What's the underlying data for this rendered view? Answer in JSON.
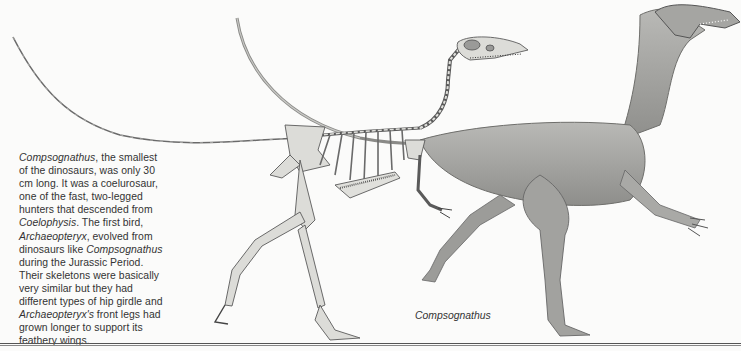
{
  "article": {
    "paragraph": {
      "lines": [
        {
          "segments": [
            {
              "text": "Compsognathus",
              "italic": true
            },
            {
              "text": ", the smallest",
              "italic": false
            }
          ]
        },
        {
          "segments": [
            {
              "text": "of the dinosaurs, was only 30",
              "italic": false
            }
          ]
        },
        {
          "segments": [
            {
              "text": "cm long. It was a coelurosaur,",
              "italic": false
            }
          ]
        },
        {
          "segments": [
            {
              "text": "one of the fast, two-legged",
              "italic": false
            }
          ]
        },
        {
          "segments": [
            {
              "text": "hunters that descended from",
              "italic": false
            }
          ]
        },
        {
          "segments": [
            {
              "text": "Coelophysis",
              "italic": true
            },
            {
              "text": ". The first bird,",
              "italic": false
            }
          ]
        },
        {
          "segments": [
            {
              "text": "Archaeopteryx",
              "italic": true
            },
            {
              "text": ", evolved from",
              "italic": false
            }
          ]
        },
        {
          "segments": [
            {
              "text": "dinosaurs like ",
              "italic": false
            },
            {
              "text": "Compsognathus",
              "italic": true
            }
          ]
        },
        {
          "segments": [
            {
              "text": "during the Jurassic Period.",
              "italic": false
            }
          ]
        },
        {
          "segments": [
            {
              "text": "Their skeletons were basically",
              "italic": false
            }
          ]
        },
        {
          "segments": [
            {
              "text": "very similar but they had",
              "italic": false
            }
          ]
        },
        {
          "segments": [
            {
              "text": "different types of hip girdle and",
              "italic": false
            }
          ]
        },
        {
          "segments": [
            {
              "text": "Archaeopteryx's",
              "italic": true
            },
            {
              "text": " front legs had",
              "italic": false
            }
          ]
        },
        {
          "segments": [
            {
              "text": "grown longer to support its",
              "italic": false
            }
          ]
        },
        {
          "segments": [
            {
              "text": "feathery wings.",
              "italic": false
            }
          ]
        }
      ]
    },
    "figure": {
      "caption": "Compsognathus",
      "subjects": [
        "skeleton",
        "reconstructed-dinosaur"
      ]
    }
  },
  "colors": {
    "paper": "#fbfbfa",
    "ink": "#333333",
    "bone": "#d8d8d4",
    "skin": "#a9a9a6",
    "skin_dark": "#7e7e7b",
    "outline": "#4a4a4a"
  }
}
